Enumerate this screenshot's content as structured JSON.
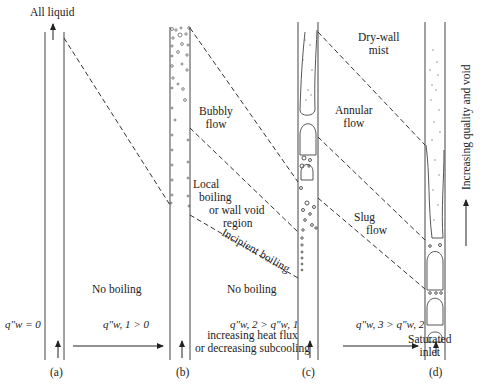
{
  "diagram": {
    "top_label": "All liquid",
    "panels": [
      {
        "id": "a",
        "label": "(a)",
        "flux_label": "q″w = 0"
      },
      {
        "id": "b",
        "label": "(b)",
        "flux_label": "q″w, 1 > 0"
      },
      {
        "id": "c",
        "label": "(c)",
        "flux_label": "q″w, 2 > q″w, 1"
      },
      {
        "id": "d",
        "label": "(d)",
        "flux_label": "q″w, 3 > q″w, 2"
      }
    ],
    "regions": {
      "no_boiling_ab": "No boiling",
      "no_boiling_bc": "No boiling",
      "bubbly_flow": [
        "Bubbly",
        "flow"
      ],
      "local_boiling": [
        "Local",
        "boiling",
        "or wall void",
        "region"
      ],
      "incipient_boiling": "Incipient boiling",
      "dry_wall_mist": [
        "Dry-wall",
        "mist"
      ],
      "annular_flow": [
        "Annular",
        "flow"
      ],
      "slug_flow": [
        "Slug",
        "flow"
      ]
    },
    "bottom_caption": [
      "increasing heat flux",
      "or decreasing subcooling"
    ],
    "saturated_inlet": [
      "Saturated",
      "inlet"
    ],
    "right_axis_label": "Increasing quality and void",
    "colors": {
      "line": "#333333",
      "background": "#ffffff"
    }
  }
}
